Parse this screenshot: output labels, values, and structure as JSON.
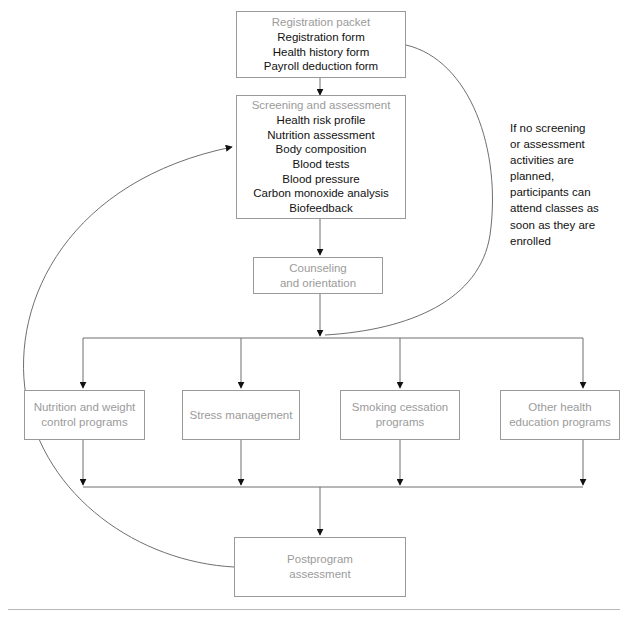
{
  "diagram": {
    "colors": {
      "box_border": "#9a9a9a",
      "heading_text": "#9b9b9b",
      "body_text": "#111111",
      "connector": "#6f6f6f",
      "arrowhead": "#111111",
      "footer_rule": "#b9b9b9",
      "background": "#ffffff"
    },
    "nodes": {
      "registration": {
        "title": "Registration packet",
        "items": "Registration form\nHealth history form\nPayroll deduction form"
      },
      "screening": {
        "title": "Screening and assessment",
        "items": "Health risk profile\nNutrition assessment\nBody composition\nBlood tests\nBlood pressure\nCarbon monoxide analysis\nBiofeedback"
      },
      "counseling": {
        "title": "Counseling\nand orientation"
      },
      "nutrition": {
        "title": "Nutrition and weight\ncontrol programs"
      },
      "stress": {
        "title": "Stress management"
      },
      "smoking": {
        "title": "Smoking cessation\nprograms"
      },
      "other_health": {
        "title": "Other health\neducation programs"
      },
      "postprogram": {
        "title": "Postprogram\nassessment"
      }
    },
    "annotation": {
      "text": "If no screening\nor assessment\nactivities are\nplanned,\nparticipants can\nattend classes as\nsoon as they are\nenrolled"
    }
  }
}
